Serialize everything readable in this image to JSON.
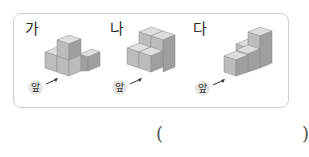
{
  "figures": [
    {
      "label": "가",
      "front_label": "앞",
      "description": "4 cubes: 3 on bottom in L shape, 1 stacked on top"
    },
    {
      "label": "나",
      "front_label": "앞",
      "description": "6 cubes: 2x2 base plus 2 cubes stacked in back row"
    },
    {
      "label": "다",
      "front_label": "앞",
      "description": "staircase of cubes rising to the back right"
    }
  ],
  "answer": {
    "open": "(",
    "close": ")",
    "value": ""
  },
  "colors": {
    "border": "#cfcfcf",
    "cube_top": "#dcdcdc",
    "cube_left": "#bdbdbd",
    "cube_right": "#9e9e9e",
    "badge": "#e6e6e6"
  }
}
